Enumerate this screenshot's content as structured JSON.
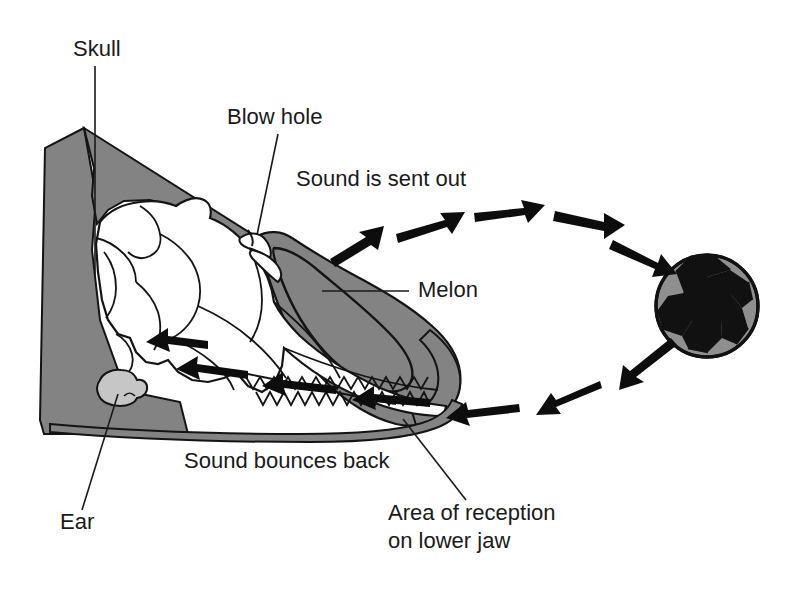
{
  "figure": {
    "background_color": "#ffffff",
    "ink_color": "#1a1a1a",
    "head_fill": "#838383",
    "melon_fill": "#838383",
    "ear_fill": "#c6c6c6",
    "skull_fill": "#ffffff",
    "ball_gray": "#8f8f8f",
    "ball_black": "#111111"
  },
  "labels": {
    "skull": {
      "text": "Skull",
      "x": 73,
      "y": 56
    },
    "blow_hole": {
      "text": "Blow hole",
      "x": 227,
      "y": 124
    },
    "sound_is_sent_out": {
      "text": "Sound is sent out",
      "x": 296,
      "y": 186
    },
    "melon": {
      "text": "Melon",
      "x": 418,
      "y": 297
    },
    "sound_bounces_back": {
      "text": "Sound bounces back",
      "x": 184,
      "y": 468
    },
    "ear": {
      "text": "Ear",
      "x": 60,
      "y": 529
    },
    "area_of_reception_line1": {
      "text": "Area of reception",
      "x": 388,
      "y": 520
    },
    "area_of_reception_line2": {
      "text": "on lower jaw",
      "x": 388,
      "y": 548
    }
  },
  "anatomy": {
    "parts": [
      "skull",
      "blow hole",
      "melon",
      "ear",
      "lower jaw",
      "teeth"
    ]
  },
  "sound_path": {
    "outgoing_label": "Sound is sent out",
    "outgoing_arrow_count": 5,
    "returning_label": "Sound bounces back",
    "returning_arrow_count": 7,
    "target_object": "soccer-ball"
  },
  "ball": {
    "name": "soccer-ball",
    "center_x": 707,
    "center_y": 306,
    "radius": 51
  }
}
